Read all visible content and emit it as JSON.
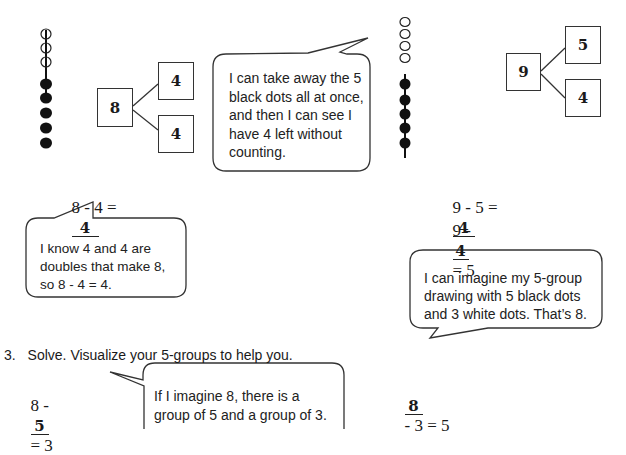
{
  "problem_a": {
    "bead_string": {
      "white_beads": 3,
      "black_beads": 5
    },
    "number_bond": {
      "whole": "8",
      "part1": "4",
      "part2": "4"
    },
    "equation": {
      "left": "8 - 4 =",
      "answer": "4"
    },
    "bubble": [
      "I know 4 and 4 are",
      "doubles that make 8,",
      "so 8 - 4 = 4."
    ]
  },
  "problem_b": {
    "bubble": [
      "I can take away the 5",
      "black dots all at once,",
      "and then I can see I",
      "have 4 left without",
      "counting."
    ],
    "bead_string": {
      "white_beads": 4,
      "black_beads": 5
    },
    "number_bond": {
      "whole": "9",
      "part1": "5",
      "part2": "4"
    },
    "equation1": {
      "left": "9 - 5 =",
      "answer": "4"
    },
    "equation2": {
      "left": "9 -",
      "answer": "4",
      "right": "= 5"
    },
    "bubble2": [
      "I can imagine my 5-group",
      "drawing with 5 black dots",
      "and 3 white dots.  That’s 8."
    ]
  },
  "question3": {
    "number": "3.",
    "instruction": "Solve.  Visualize your 5-groups to help you.",
    "eq1": {
      "left": "8 -",
      "answer": "5",
      "right": "= 3"
    },
    "bubble": [
      "If I imagine 8, there is a",
      "group of 5 and a group of 3."
    ],
    "eq2": {
      "answer": "8",
      "right": "- 3 = 5"
    }
  }
}
